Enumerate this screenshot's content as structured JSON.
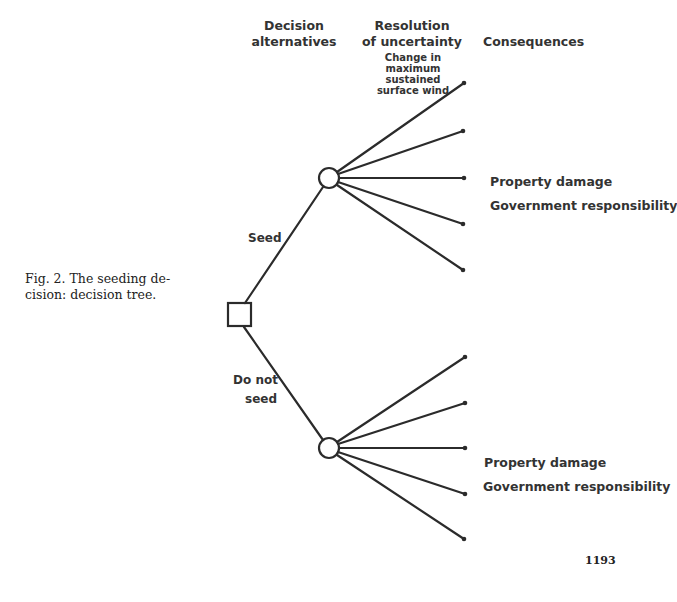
{
  "headers": {
    "decision_alternatives": [
      "Decision",
      "alternatives"
    ],
    "resolution_of_uncertainty": [
      "Resolution",
      "of uncertainty"
    ],
    "uncertainty_variable": [
      "Change in",
      "maximum",
      "sustained",
      "surface wind"
    ],
    "consequences": "Consequences"
  },
  "caption": [
    "Fig. 2. The seeding de-",
    "cision: decision tree."
  ],
  "tree": {
    "decision_node": {
      "shape": "square",
      "label": "Seeding decision"
    },
    "branches": [
      {
        "label": [
          "Seed"
        ],
        "chance_node": {
          "shape": "circle"
        },
        "outcome_count": 5,
        "consequences": [
          "Property damage",
          "Government responsibility"
        ]
      },
      {
        "label": [
          "Do not",
          "seed"
        ],
        "chance_node": {
          "shape": "circle"
        },
        "outcome_count": 5,
        "consequences": [
          "Property damage",
          "Government responsibility"
        ]
      }
    ]
  },
  "page_number": "1193",
  "colors": {
    "ink": "#2a2a2a",
    "background": "#ffffff"
  }
}
